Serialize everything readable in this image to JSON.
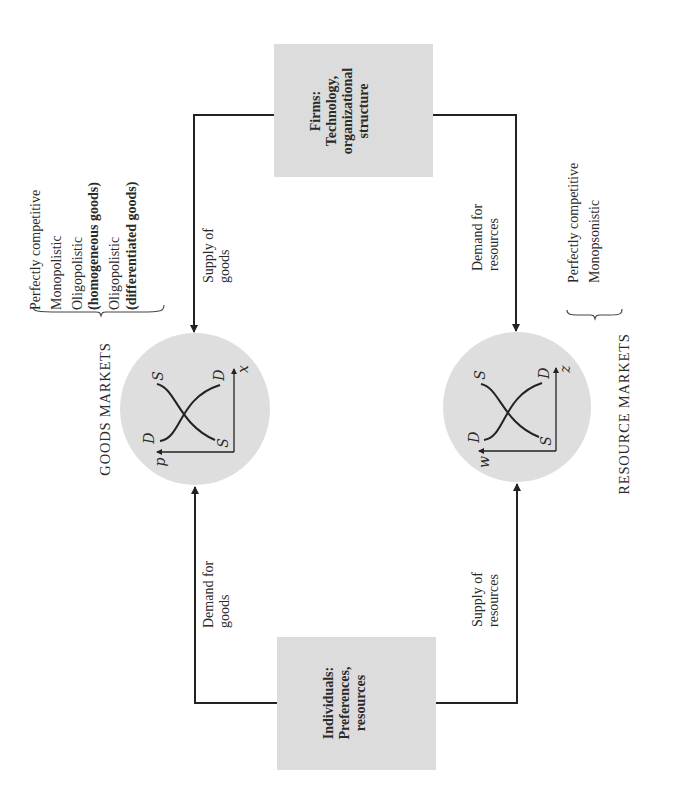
{
  "orientation": "rotated 90 degrees counter-clockwise",
  "nodes": {
    "firms": {
      "title": "Firms:",
      "line1": "Technology,",
      "line2": "organizational",
      "line3": "structure"
    },
    "individuals": {
      "title": "Individuals:",
      "line1": "Preferences,",
      "line2": "resources"
    }
  },
  "markets": {
    "goods": {
      "title": "GOODS MARKETS",
      "axis_price": "p",
      "axis_quantity": "x",
      "curve_demand": "D",
      "curve_supply": "S",
      "types": [
        {
          "text": "Perfectly competitive"
        },
        {
          "text": "Monopolistic"
        },
        {
          "text": "Oligopolistic",
          "sub": "(homogeneous goods)"
        },
        {
          "text": "Oligopolistic",
          "sub": "(differentiated goods)"
        }
      ]
    },
    "resources": {
      "title": "RESOURCE MARKETS",
      "axis_price": "w",
      "axis_quantity": "z",
      "curve_demand": "D",
      "curve_supply": "S",
      "types": [
        {
          "text": "Perfectly competitive"
        },
        {
          "text": "Monopsonistic"
        }
      ]
    }
  },
  "flows": {
    "supply_of_goods": {
      "line1": "Supply of",
      "line2": "goods"
    },
    "demand_for_goods": {
      "line1": "Demand for",
      "line2": "goods"
    },
    "demand_for_resources": {
      "line1": "Demand for",
      "line2": "resources"
    },
    "supply_of_resources": {
      "line1": "Supply of",
      "line2": "resources"
    }
  },
  "colors": {
    "box_fill": "#dcdcdc",
    "circle_fill": "#dedede",
    "line": "#222222"
  }
}
